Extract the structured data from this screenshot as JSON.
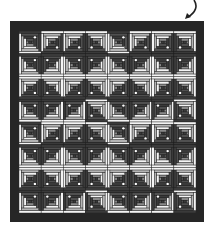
{
  "illustration": {
    "caption": "Log cabin quilt layout",
    "arrow_icon": "curved-arrow-down-left-icon",
    "colors": {
      "border": "#262626",
      "dark": "#3a3a3a",
      "dark_alt": "#505050",
      "mid": "#8a8a8a",
      "light_grey": "#b4b4b4",
      "white": "#f4f4f4",
      "dot": "#ffffff",
      "seam": "#1e1e1e"
    },
    "grid": {
      "rows": 8,
      "cols": 8
    },
    "motif": [
      [
        "BL",
        "TL",
        "TL",
        "TR"
      ],
      [
        "BL",
        "BR",
        "BL",
        "BR"
      ],
      [
        "TL",
        "TR",
        "TL",
        "TR"
      ],
      [
        "BL",
        "BR",
        "BR",
        "TR"
      ]
    ]
  }
}
